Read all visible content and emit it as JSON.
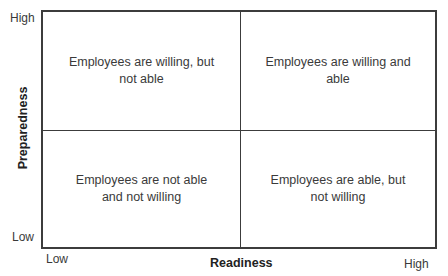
{
  "diagram": {
    "type": "2x2 matrix",
    "y_axis": {
      "title": "Preparedness",
      "high_label": "High",
      "low_label": "Low"
    },
    "x_axis": {
      "title": "Readiness",
      "low_label": "Low",
      "high_label": "High"
    },
    "quadrants": {
      "top_left": "Employees are willing, but not able",
      "top_right": "Employees are willing and able",
      "bottom_left": "Employees are not able and not willing",
      "bottom_right": "Employees are able, but not willing"
    },
    "line_color": "#3c3c3c",
    "text_color": "#3a3a3a"
  }
}
